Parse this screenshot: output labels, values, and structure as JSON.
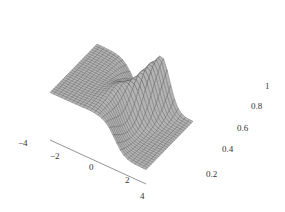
{
  "chart_data": {
    "type": "surface3d",
    "title": "",
    "xlabel": "",
    "ylabel": "",
    "zlabel": "",
    "x_ticks": [
      "-4",
      "-2",
      "0",
      "2",
      "4"
    ],
    "z_ticks": [
      "0.2",
      "0.4",
      "0.6",
      "0.8",
      "1"
    ],
    "xlim": [
      -4.5,
      4.5
    ],
    "ylim": [
      -4.5,
      4.5
    ],
    "zlim": [
      0,
      1
    ],
    "grid": "mesh",
    "legend": "none",
    "features": {
      "left_plateau_height": 0.5,
      "peak_height": 1.0,
      "right_floor_height": 0.15,
      "peak_location_x": 1.0
    },
    "colors": {
      "surface_fill": "#b4b4b4",
      "mesh_line": "#555555",
      "axis_line": "#666666",
      "tick_text": "#333333"
    }
  },
  "axes": {
    "x_tick_labels": [
      {
        "text": "−4",
        "left": 18,
        "top": 139
      },
      {
        "text": "−2",
        "left": 50,
        "top": 152
      },
      {
        "text": "0",
        "left": 89,
        "top": 163
      },
      {
        "text": "2",
        "left": 125,
        "top": 176
      },
      {
        "text": "4",
        "left": 140,
        "top": 192
      }
    ],
    "z_tick_labels": [
      {
        "text": "1",
        "left": 265,
        "top": 82
      },
      {
        "text": "0.8",
        "left": 251,
        "top": 102
      },
      {
        "text": "0.6",
        "left": 237,
        "top": 124
      },
      {
        "text": "0.4",
        "left": 222,
        "top": 145
      },
      {
        "text": "0.2",
        "left": 206,
        "top": 170
      }
    ]
  }
}
